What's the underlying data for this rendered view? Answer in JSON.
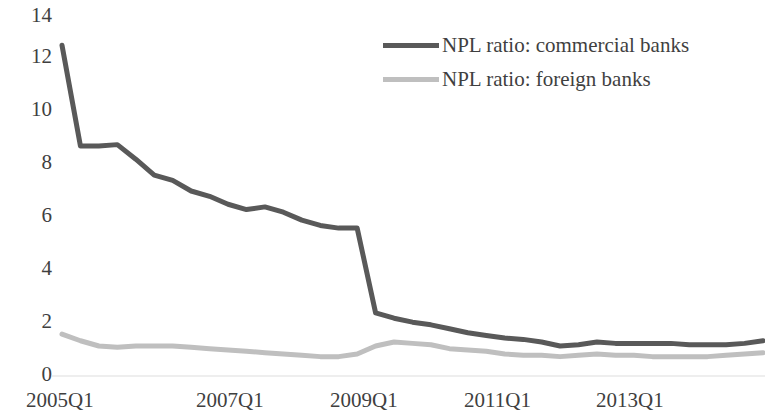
{
  "chart_data": {
    "type": "line",
    "title": "",
    "xlabel": "",
    "ylabel": "",
    "ylim": [
      0,
      14
    ],
    "y_ticks": [
      0,
      2,
      4,
      6,
      8,
      10,
      12,
      14
    ],
    "grid": false,
    "legend_position": "top-right",
    "x_tick_labels": [
      "2005Q1",
      "2007Q1",
      "2009Q1",
      "2011Q1",
      "2013Q1"
    ],
    "x_tick_indices": [
      0,
      8,
      16,
      24,
      32
    ],
    "x": [
      "2005Q1",
      "2005Q2",
      "2005Q3",
      "2005Q4",
      "2006Q1",
      "2006Q2",
      "2006Q3",
      "2006Q4",
      "2007Q1",
      "2007Q2",
      "2007Q3",
      "2007Q4",
      "2008Q1",
      "2008Q2",
      "2008Q3",
      "2008Q4",
      "2009Q1",
      "2009Q2",
      "2009Q3",
      "2009Q4",
      "2010Q1",
      "2010Q2",
      "2010Q3",
      "2010Q4",
      "2011Q1",
      "2011Q2",
      "2011Q3",
      "2011Q4",
      "2012Q1",
      "2012Q2",
      "2012Q3",
      "2012Q4",
      "2013Q1",
      "2013Q2",
      "2013Q3",
      "2013Q4",
      "2014Q1",
      "2014Q2",
      "2014Q3"
    ],
    "series": [
      {
        "name": "NPL ratio: commercial banks",
        "color": "#595959",
        "values": [
          12.5,
          8.7,
          8.7,
          8.75,
          8.2,
          7.6,
          7.4,
          7.0,
          6.8,
          6.5,
          6.3,
          6.4,
          6.2,
          5.9,
          5.7,
          5.6,
          5.6,
          2.4,
          2.2,
          2.05,
          1.95,
          1.8,
          1.65,
          1.55,
          1.45,
          1.4,
          1.3,
          1.15,
          1.2,
          1.3,
          1.25,
          1.25,
          1.25,
          1.25,
          1.2,
          1.2,
          1.2,
          1.25,
          1.35
        ]
      },
      {
        "name": "NPL ratio: foreign banks",
        "color": "#bfbfbf",
        "values": [
          1.6,
          1.35,
          1.15,
          1.1,
          1.15,
          1.15,
          1.15,
          1.1,
          1.05,
          1.0,
          0.95,
          0.9,
          0.85,
          0.8,
          0.75,
          0.75,
          0.85,
          1.15,
          1.3,
          1.25,
          1.2,
          1.05,
          1.0,
          0.95,
          0.85,
          0.8,
          0.8,
          0.75,
          0.8,
          0.85,
          0.8,
          0.8,
          0.75,
          0.75,
          0.75,
          0.75,
          0.8,
          0.85,
          0.9
        ]
      }
    ]
  },
  "legend": {
    "items": [
      {
        "label": "NPL ratio: commercial banks",
        "color": "#595959"
      },
      {
        "label": "NPL ratio: foreign banks",
        "color": "#bfbfbf"
      }
    ]
  },
  "axes": {
    "y_labels": [
      "14",
      "12",
      "10",
      "8",
      "6",
      "4",
      "2",
      "0"
    ],
    "x_labels": [
      "2005Q1",
      "2007Q1",
      "2009Q1",
      "2011Q1",
      "2013Q1"
    ]
  }
}
